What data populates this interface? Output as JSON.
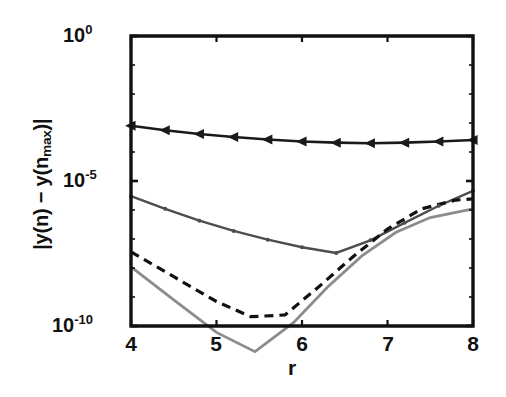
{
  "chart_data": {
    "type": "line",
    "title": "",
    "subtitle": "",
    "xlabel": "r",
    "ylabel": "|y(n) − y(n_max)|",
    "ylabel_parts": {
      "prefix": "|y(n) − y(n",
      "sub": "max",
      "suffix": ")|"
    },
    "xlim": [
      4,
      8
    ],
    "ylim": [
      1e-10,
      1
    ],
    "yscale": "log",
    "xscale": "linear",
    "grid": false,
    "legend": false,
    "legend_position": "none",
    "xticks": [
      4,
      5,
      6,
      7,
      8
    ],
    "xtick_labels": [
      "4",
      "5",
      "6",
      "7",
      "8"
    ],
    "yticks": [
      1,
      1e-05,
      1e-10
    ],
    "ytick_labels": [
      {
        "mantissa": "10",
        "exponent": "0"
      },
      {
        "mantissa": "10",
        "exponent": "-5"
      },
      {
        "mantissa": "10",
        "exponent": "-10"
      }
    ],
    "axis_color": "#111111",
    "background": "#ffffff",
    "series": [
      {
        "name": "triangle-marker-curve",
        "color": "#1a1a1a",
        "linestyle": "solid",
        "linewidth": 2.6,
        "marker": "left-triangle",
        "marker_size": 10,
        "x": [
          4.0,
          4.4,
          4.8,
          5.2,
          5.6,
          6.0,
          6.4,
          6.8,
          7.2,
          7.6,
          8.0
        ],
        "y": [
          0.0008,
          0.00056,
          0.00042,
          0.00033,
          0.00027,
          0.00023,
          0.00021,
          0.0002,
          0.00021,
          0.00023,
          0.00026
        ]
      },
      {
        "name": "dot-marker-curve",
        "color": "#4d4d4d",
        "linestyle": "solid",
        "linewidth": 2.4,
        "marker": "dot",
        "marker_size": 4,
        "x": [
          4.0,
          4.4,
          4.8,
          5.2,
          5.6,
          6.0,
          6.4,
          6.8,
          7.2,
          7.6,
          8.0
        ],
        "y": [
          3e-06,
          1.1e-06,
          4.3e-07,
          1.9e-07,
          9.5e-08,
          5.2e-08,
          3.3e-08,
          9e-08,
          3.6e-07,
          1.4e-06,
          4.6e-06
        ]
      },
      {
        "name": "dashed-curve",
        "color": "#111111",
        "linestyle": "dashed",
        "linewidth": 3.2,
        "marker": "none",
        "x": [
          4.0,
          4.5,
          5.0,
          5.4,
          5.8,
          6.2,
          6.6,
          7.0,
          7.4,
          7.8,
          8.0
        ],
        "y": [
          3.6e-08,
          5e-09,
          7e-10,
          2.1e-10,
          2.4e-10,
          2.3e-09,
          2.5e-08,
          2.2e-07,
          1.1e-06,
          2.2e-06,
          2.4e-06
        ]
      },
      {
        "name": "solid-gray-curve",
        "color": "#8c8c8c",
        "linestyle": "solid",
        "linewidth": 2.8,
        "marker": "none",
        "x": [
          4.0,
          4.5,
          5.0,
          5.45,
          5.9,
          6.3,
          6.7,
          7.1,
          7.5,
          8.0
        ],
        "y": [
          1.1e-08,
          8e-10,
          6e-11,
          1.3e-11,
          1.3e-10,
          2.2e-09,
          2.6e-08,
          1.7e-07,
          5.5e-07,
          1.1e-06
        ]
      }
    ],
    "annotations": []
  },
  "geometry": {
    "plot_left": 131,
    "plot_right": 473,
    "plot_top": 36,
    "plot_bottom": 326
  }
}
